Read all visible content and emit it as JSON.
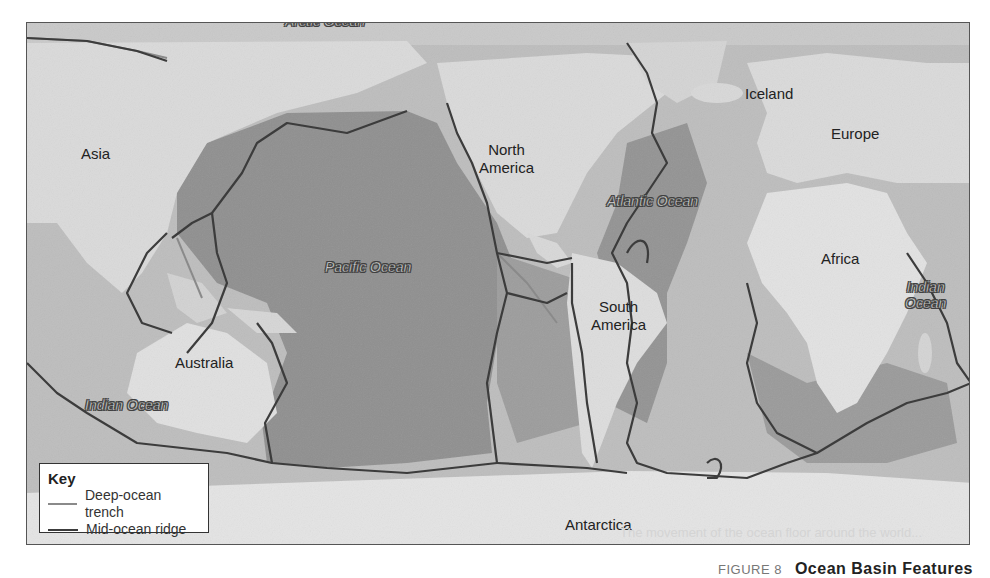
{
  "map": {
    "continents": [
      {
        "id": "asia",
        "label": "Asia"
      },
      {
        "id": "north-america",
        "label": "North\nAmerica",
        "line1": "North",
        "line2": "America"
      },
      {
        "id": "south-america",
        "label": "South America",
        "line1": "South",
        "line2": "America"
      },
      {
        "id": "iceland",
        "label": "Iceland"
      },
      {
        "id": "europe",
        "label": "Europe"
      },
      {
        "id": "africa",
        "label": "Africa"
      },
      {
        "id": "australia",
        "label": "Australia"
      },
      {
        "id": "antarctica",
        "label": "Antarctica"
      }
    ],
    "oceans": [
      {
        "id": "arctic",
        "label": "Arctic Ocean"
      },
      {
        "id": "atlantic",
        "label": "Atlantic Ocean"
      },
      {
        "id": "pacific",
        "label": "Pacific Ocean"
      },
      {
        "id": "indian-east",
        "line1": "Indian",
        "line2": "Ocean"
      },
      {
        "id": "indian-west",
        "label": "Indian Ocean"
      }
    ],
    "colors": {
      "land": "#dadada",
      "ocean_shallow": "#bdbdbd",
      "ocean_deep": "#8f8f8f",
      "trench": "#8a8a8a",
      "ridge": "#3c3c3c"
    }
  },
  "key": {
    "title": "Key",
    "items": [
      {
        "label": "Deep-ocean trench",
        "color": "#8a8a8a"
      },
      {
        "label": "Mid-ocean ridge",
        "color": "#3c3c3c"
      }
    ]
  },
  "caption": {
    "figure": "FIGURE 8",
    "title": "Ocean Basin Features"
  },
  "ghost_text": "The movement of the ocean floor around the world..."
}
